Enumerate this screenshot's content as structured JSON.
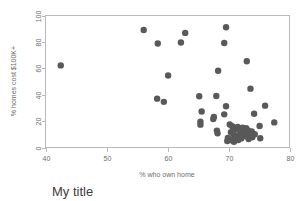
{
  "chart_data": {
    "type": "scatter",
    "title": "My title",
    "xlabel": "% who own home",
    "ylabel": "% homes cost $100K+",
    "xlim": [
      40,
      80
    ],
    "ylim": [
      0,
      100
    ],
    "xticks": [
      40,
      50,
      60,
      70,
      80
    ],
    "yticks": [
      0,
      20,
      40,
      60,
      80,
      100
    ],
    "grid": false,
    "legend": null,
    "marker_color": "#595959",
    "marker_size": 3.2,
    "frame_color": "#b9b9b9",
    "background": "#ffffff",
    "points": [
      [
        42.5,
        62.2
      ],
      [
        56.1,
        89.0
      ],
      [
        58.4,
        78.8
      ],
      [
        62.2,
        79.5
      ],
      [
        62.9,
        86.8
      ],
      [
        69.6,
        91.1
      ],
      [
        69.3,
        79.2
      ],
      [
        73.0,
        65.3
      ],
      [
        60.1,
        54.5
      ],
      [
        68.3,
        58.1
      ],
      [
        73.6,
        44.6
      ],
      [
        58.3,
        37.0
      ],
      [
        59.4,
        34.6
      ],
      [
        65.2,
        38.8
      ],
      [
        68.0,
        39.0
      ],
      [
        69.6,
        31.2
      ],
      [
        76.0,
        31.7
      ],
      [
        65.6,
        27.3
      ],
      [
        69.3,
        25.1
      ],
      [
        67.6,
        23.2
      ],
      [
        67.5,
        21.6
      ],
      [
        74.2,
        25.6
      ],
      [
        77.5,
        19.0
      ],
      [
        75.1,
        16.3
      ],
      [
        65.4,
        19.6
      ],
      [
        65.4,
        17.3
      ],
      [
        68.1,
        12.8
      ],
      [
        68.2,
        10.8
      ],
      [
        70.2,
        17.4
      ],
      [
        70.6,
        16.1
      ],
      [
        70.9,
        14.9
      ],
      [
        71.2,
        13.8
      ],
      [
        71.5,
        15.6
      ],
      [
        71.9,
        14.2
      ],
      [
        72.3,
        15.0
      ],
      [
        72.6,
        13.4
      ],
      [
        72.9,
        14.6
      ],
      [
        73.2,
        13.0
      ],
      [
        70.4,
        11.5
      ],
      [
        70.8,
        10.2
      ],
      [
        71.1,
        9.0
      ],
      [
        71.4,
        8.1
      ],
      [
        71.8,
        9.5
      ],
      [
        72.2,
        8.6
      ],
      [
        72.6,
        9.8
      ],
      [
        73.0,
        8.4
      ],
      [
        73.4,
        10.5
      ],
      [
        69.9,
        7.3
      ],
      [
        70.3,
        6.1
      ],
      [
        70.7,
        5.2
      ],
      [
        71.0,
        6.6
      ],
      [
        71.6,
        5.6
      ],
      [
        72.1,
        6.9
      ],
      [
        73.3,
        6.4
      ],
      [
        73.8,
        12.1
      ],
      [
        74.3,
        10.0
      ],
      [
        75.2,
        7.0
      ],
      [
        69.8,
        4.9
      ],
      [
        70.9,
        4.4
      ],
      [
        72.0,
        11.8
      ],
      [
        73.9,
        7.7
      ]
    ]
  }
}
